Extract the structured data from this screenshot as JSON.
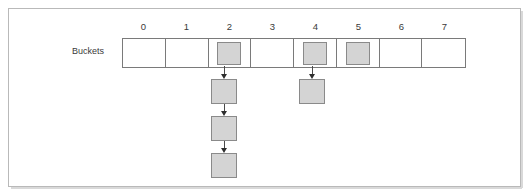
{
  "figure": {
    "row_label": "Buckets",
    "column_headers": [
      "0",
      "1",
      "2",
      "3",
      "4",
      "5",
      "6",
      "7"
    ],
    "buckets": [
      {
        "index": "0",
        "occupied": false,
        "chain_length": 0
      },
      {
        "index": "1",
        "occupied": false,
        "chain_length": 0
      },
      {
        "index": "2",
        "occupied": true,
        "chain_length": 3
      },
      {
        "index": "3",
        "occupied": false,
        "chain_length": 0
      },
      {
        "index": "4",
        "occupied": true,
        "chain_length": 1
      },
      {
        "index": "5",
        "occupied": true,
        "chain_length": 0
      },
      {
        "index": "6",
        "occupied": false,
        "chain_length": 0
      },
      {
        "index": "7",
        "occupied": false,
        "chain_length": 0
      }
    ],
    "colors": {
      "node_fill": "#d4d4d4",
      "node_border": "#8a8a8a",
      "cell_border": "#7a7a7a",
      "frame_border": "#b9b9b9",
      "arrow": "#2e2e2e",
      "text": "#3a3a3a",
      "background": "#ffffff"
    }
  }
}
